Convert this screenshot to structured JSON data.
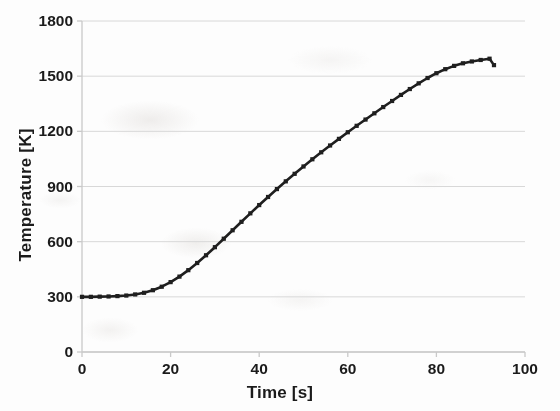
{
  "figure": {
    "background_color": "#fdfdfd",
    "axis_color": "#c9c9c9",
    "grid_color": "#d8d8d8",
    "series_color": "#1f1f1f",
    "text_color": "#1b1b1b"
  },
  "axes": {
    "x_title": "Time [s]",
    "y_title": "Temperature [K]",
    "x_ticks": [
      "0",
      "20",
      "40",
      "60",
      "80",
      "100"
    ],
    "y_ticks": [
      "0",
      "300",
      "600",
      "900",
      "1200",
      "1500",
      "1800"
    ]
  },
  "chart_data": {
    "type": "line",
    "title": "",
    "subtitle": "",
    "xlabel": "Time [s]",
    "ylabel": "Temperature [K]",
    "xlim": [
      0,
      100
    ],
    "ylim": [
      0,
      1800
    ],
    "xticks": [
      0,
      20,
      40,
      60,
      80,
      100
    ],
    "yticks": [
      0,
      300,
      600,
      900,
      1200,
      1500,
      1800
    ],
    "grid": "horizontal",
    "legend": null,
    "legend_position": "none",
    "marker": "square",
    "line_style": "solid",
    "annotations": [],
    "series": [
      {
        "name": "Temperature",
        "color": "#1f1f1f",
        "x": [
          0,
          2,
          4,
          6,
          8,
          10,
          12,
          14,
          16,
          18,
          20,
          22,
          24,
          26,
          28,
          30,
          32,
          34,
          36,
          38,
          40,
          42,
          44,
          46,
          48,
          50,
          52,
          54,
          56,
          58,
          60,
          62,
          64,
          66,
          68,
          70,
          72,
          74,
          76,
          78,
          80,
          82,
          84,
          86,
          88,
          90,
          92,
          93
        ],
        "y": [
          300,
          300,
          301,
          302,
          304,
          307,
          313,
          322,
          336,
          355,
          380,
          410,
          445,
          484,
          526,
          570,
          616,
          662,
          708,
          754,
          799,
          843,
          886,
          928,
          969,
          1009,
          1048,
          1086,
          1123,
          1159,
          1195,
          1230,
          1264,
          1298,
          1332,
          1365,
          1398,
          1430,
          1461,
          1490,
          1516,
          1538,
          1556,
          1570,
          1580,
          1588,
          1595,
          1560
        ]
      }
    ]
  }
}
